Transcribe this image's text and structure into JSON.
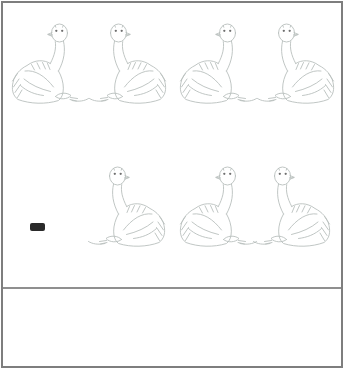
{
  "worksheet": {
    "type": "picture-subtraction",
    "minuend_row": {
      "count": 4,
      "birds": [
        {
          "facing": "right"
        },
        {
          "facing": "left"
        },
        {
          "facing": "right"
        },
        {
          "facing": "left"
        }
      ]
    },
    "operator": {
      "symbol": "minus"
    },
    "subtrahend_row": {
      "count": 3,
      "birds": [
        {
          "facing": "left"
        },
        {
          "facing": "right"
        },
        {
          "facing": "left"
        }
      ]
    },
    "answer_box": {
      "content": ""
    }
  },
  "icons": {
    "bird": "ostrich-illustration",
    "operator": "minus-sign"
  },
  "colors": {
    "frame_border": "#7e7e7e",
    "separator": "#8f8f8f",
    "sketch_line": "#b9bfbd",
    "eye": "#6f6f6f",
    "minus": "#2a2a2a",
    "background": "#ffffff"
  }
}
